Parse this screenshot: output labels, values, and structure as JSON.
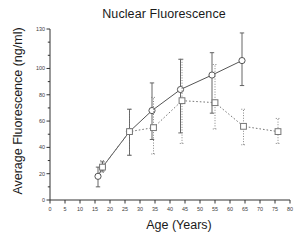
{
  "chart_data": {
    "type": "scatter",
    "title": "Nuclear Fluorescence",
    "xlabel": "Age (Years)",
    "ylabel": "Average Fluorescence (ng/ml)",
    "xlim": [
      0,
      80
    ],
    "ylim": [
      0,
      130
    ],
    "xticks": [
      0,
      5,
      10,
      15,
      20,
      25,
      30,
      35,
      40,
      45,
      50,
      55,
      60,
      65,
      70,
      75,
      80
    ],
    "yticks": [
      0,
      20,
      40,
      60,
      80,
      100,
      130
    ],
    "ytick_minor": [
      10,
      30,
      50,
      70,
      90,
      110,
      120
    ],
    "grid": false,
    "legend": "none",
    "series": [
      {
        "name": "open-circle-solid-line",
        "marker": "circle",
        "line": "solid",
        "color": "#555555",
        "points": [
          {
            "x": 16.0,
            "y": 18,
            "err_low": 10,
            "err_high": 25
          },
          {
            "x": 17.5,
            "y": 25,
            "err_low": 22,
            "err_high": 29
          },
          {
            "x": 26.5,
            "y": 52,
            "err_low": 34,
            "err_high": 69
          },
          {
            "x": 34.0,
            "y": 68,
            "err_low": 46,
            "err_high": 89
          },
          {
            "x": 43.5,
            "y": 84,
            "err_low": 51,
            "err_high": 107
          },
          {
            "x": 54.0,
            "y": 95,
            "err_low": 66,
            "err_high": 112
          },
          {
            "x": 64.0,
            "y": 106,
            "err_low": 87,
            "err_high": 127
          }
        ]
      },
      {
        "name": "open-square-dotted-line",
        "marker": "square",
        "line": "dotted",
        "color": "#777777",
        "points": [
          {
            "x": 17.5,
            "y": 25,
            "err_low": 21,
            "err_high": 30
          },
          {
            "x": 26.5,
            "y": 52,
            "err_low": 34,
            "err_high": 69
          },
          {
            "x": 34.5,
            "y": 55,
            "err_low": 35,
            "err_high": 78
          },
          {
            "x": 44.0,
            "y": 75.5,
            "err_low": 43,
            "err_high": 107
          },
          {
            "x": 55.0,
            "y": 74,
            "err_low": 54,
            "err_high": 103
          },
          {
            "x": 64.5,
            "y": 56,
            "err_low": 42,
            "err_high": 69
          },
          {
            "x": 76.0,
            "y": 52,
            "err_low": 43,
            "err_high": 62
          }
        ]
      }
    ]
  }
}
